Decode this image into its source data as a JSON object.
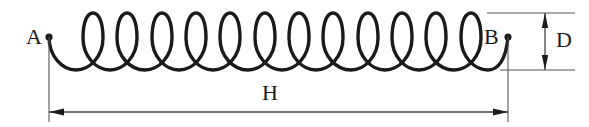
{
  "diagram": {
    "type": "coil-spring-helix-dimension-drawing",
    "stroke_color": "#1a1a1a",
    "dimension_line_color": "#444444",
    "background_color": "#ffffff",
    "labels": {
      "start_point": "A",
      "end_point": "B",
      "diameter": "D",
      "length": "H"
    },
    "geometry": {
      "coil_turns": 12,
      "point_a_x": 49,
      "point_a_y": 37,
      "point_b_x": 508,
      "point_b_y": 37,
      "loop_top_y": 13,
      "loop_bottom_y": 70,
      "first_loop_center_x": 93,
      "loop_pitch": 34.3,
      "loop_half_width": 14,
      "crossover_y": 57,
      "h_dimension_y": 112,
      "h_extension_left_x": 49,
      "h_extension_right_x": 508,
      "d_dimension_x": 545,
      "d_extension_top_y": 13,
      "d_extension_bottom_y": 70,
      "d_extension_right_x": 575
    }
  }
}
